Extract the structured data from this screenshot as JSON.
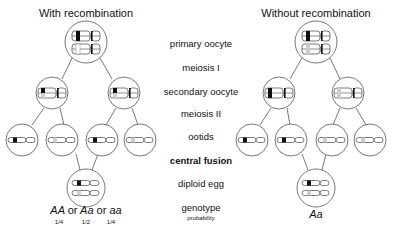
{
  "panels": {
    "left": {
      "title": "With recombination",
      "genotype": {
        "parts": [
          "AA",
          "or",
          "Aa",
          "or",
          "aa"
        ]
      },
      "probabilities": [
        "1/4",
        "1/2",
        "1/4"
      ]
    },
    "right": {
      "title": "Without recombination",
      "genotype": "Aa"
    }
  },
  "stages": {
    "primary_oocyte": "primary oocyte",
    "meiosis_1": "meiosis I",
    "secondary_oocyte": "secondary oocyte",
    "meiosis_2": "meiosis II",
    "ootids": "ootids",
    "central_fusion": "central fusion",
    "diploid_egg": "diploid egg",
    "genotype": "genotype",
    "probability": "probability"
  },
  "colors": {
    "line": "#555555",
    "allele_A": "#111111",
    "allele_a": "#aaaaaa"
  }
}
